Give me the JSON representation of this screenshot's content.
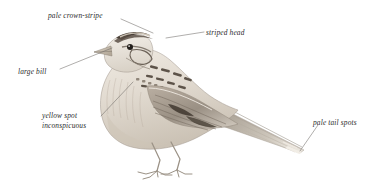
{
  "figure": {
    "type": "field-guide-illustration",
    "background_color": "#ffffff",
    "text_color": "#2b2b2b",
    "leader_color": "#6e6a66",
    "plumage_colors": {
      "crown_stripe_dark": "#4a4038",
      "crown_stripe_pale": "#c8bdb0",
      "body_base": "#e6e0d7",
      "streak_dark": "#50463c",
      "wing_mid": "#a2978a",
      "bill_pale": "#d8cfc2",
      "eye_dark": "#221e1b",
      "leg_pale": "#cfc5b7",
      "shadow": "#b9b1a6"
    }
  },
  "annotations": [
    {
      "id": "pale-crown-stripe",
      "text": "pale crown-stripe",
      "x": 48,
      "y": 11,
      "leader": {
        "x1": 121,
        "y1": 19,
        "x2": 153,
        "y2": 33
      }
    },
    {
      "id": "striped-head",
      "text": "striped head",
      "x": 206,
      "y": 28,
      "leader": {
        "x1": 204,
        "y1": 32,
        "x2": 166,
        "y2": 38
      }
    },
    {
      "id": "large-bill",
      "text": "large bill",
      "x": 18,
      "y": 67,
      "leader": {
        "x1": 60,
        "y1": 69,
        "x2": 112,
        "y2": 48
      }
    },
    {
      "id": "yellow-spot-inconspicuous",
      "text": "yellow spot\ninconspicuous",
      "x": 42,
      "y": 111,
      "leader": {
        "x1": 101,
        "y1": 116,
        "x2": 133,
        "y2": 82
      }
    },
    {
      "id": "pale-tail-spots",
      "text": "pale tail spots",
      "x": 313,
      "y": 118,
      "leader": {
        "x1": 318,
        "y1": 125,
        "x2": 300,
        "y2": 151
      }
    }
  ]
}
